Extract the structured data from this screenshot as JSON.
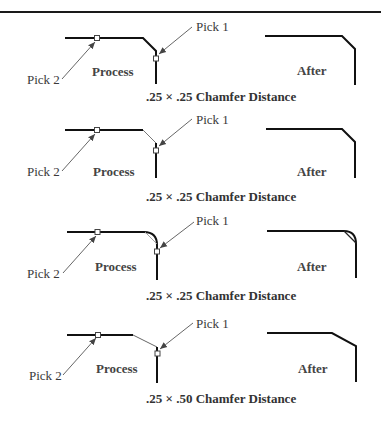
{
  "figure": {
    "panels": [
      {
        "id": "p1",
        "pick1_label": "Pick 1",
        "pick2_label": "Pick 2",
        "process_label": "Process",
        "after_label": "After",
        "caption": ".25 × .25 Chamfer Distance",
        "result_type": "chamfer"
      },
      {
        "id": "p2",
        "pick1_label": "Pick 1",
        "pick2_label": "Pick 2",
        "process_label": "Process",
        "after_label": "After",
        "caption": ".25 × .25 Chamfer Distance",
        "result_type": "chamfer"
      },
      {
        "id": "p3",
        "pick1_label": "Pick 1",
        "pick2_label": "Pick 2",
        "process_label": "Process",
        "after_label": "After",
        "caption": ".25 × .25 Chamfer Distance",
        "result_type": "chamfer-on-fillet"
      },
      {
        "id": "p4",
        "pick1_label": "Pick 1",
        "pick2_label": "Pick 2",
        "process_label": "Process",
        "after_label": "After",
        "caption": ".25 × .50 Chamfer Distance",
        "result_type": "chamfer"
      }
    ]
  },
  "colors": {
    "line": "#111111",
    "leader": "#555555",
    "thin_chamfer": "#888888"
  }
}
